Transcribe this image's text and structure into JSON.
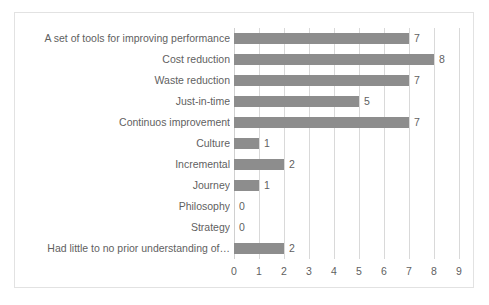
{
  "chart_data": {
    "type": "bar",
    "orientation": "horizontal",
    "title": "",
    "subtitle": "",
    "xlabel": "",
    "ylabel": "",
    "xlim": [
      0,
      9
    ],
    "xticks": [
      "0",
      "1",
      "2",
      "3",
      "4",
      "5",
      "6",
      "7",
      "8",
      "9"
    ],
    "grid": "vertical",
    "legend": "none",
    "bar_color": "#8d8d8d",
    "gridline_color": "#d9d9d9",
    "text_color": "#5f5f5f",
    "border_color": "#e2e2e2",
    "show_data_labels": true,
    "categories": [
      "Had little to no prior understanding of…",
      "Strategy",
      "Philosophy",
      "Journey",
      "Incremental",
      "Culture",
      "Continuos improvement",
      "Just-in-time",
      "Waste reduction",
      "Cost reduction",
      "A set of tools for improving performance"
    ],
    "values": [
      2,
      0,
      0,
      1,
      2,
      1,
      7,
      5,
      7,
      8,
      7
    ],
    "data_labels": [
      "2",
      "0",
      "0",
      "1",
      "2",
      "1",
      "7",
      "5",
      "7",
      "8",
      "7"
    ]
  }
}
